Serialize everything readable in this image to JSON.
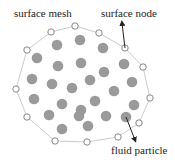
{
  "labels": {
    "surface_mesh": "surface mesh",
    "surface_node": "surface node",
    "fluid_particle": "fluid particle"
  },
  "colors": {
    "mesh_line": "#bdbdbd",
    "node_stroke": "#7a7a7a",
    "node_fill": "#ffffff",
    "particle_fill": "#9a9a9a",
    "arrow": "#222222"
  },
  "surface_nodes": [
    [
      27,
      50
    ],
    [
      51,
      32
    ],
    [
      75,
      26
    ],
    [
      99,
      33
    ],
    [
      125,
      48
    ],
    [
      143,
      67
    ],
    [
      150,
      98
    ],
    [
      139,
      123
    ],
    [
      118,
      137
    ],
    [
      87,
      142
    ],
    [
      55,
      141
    ],
    [
      27,
      117
    ],
    [
      16,
      89
    ]
  ],
  "fluid_particles": [
    [
      57,
      45
    ],
    [
      80,
      40
    ],
    [
      103,
      48
    ],
    [
      37,
      58
    ],
    [
      58,
      66
    ],
    [
      81,
      63
    ],
    [
      104,
      72
    ],
    [
      124,
      64
    ],
    [
      32,
      79
    ],
    [
      52,
      84
    ],
    [
      72,
      88
    ],
    [
      90,
      80
    ],
    [
      114,
      91
    ],
    [
      132,
      82
    ],
    [
      34,
      99
    ],
    [
      62,
      104
    ],
    [
      81,
      110
    ],
    [
      95,
      101
    ],
    [
      134,
      105
    ],
    [
      49,
      115
    ],
    [
      79,
      116
    ],
    [
      106,
      116
    ],
    [
      126,
      117
    ],
    [
      62,
      129
    ],
    [
      88,
      126
    ]
  ],
  "arrows": [
    {
      "name": "surface-node-arrow",
      "from": [
        125,
        48
      ],
      "to": [
        122,
        23
      ]
    },
    {
      "name": "fluid-particle-arrow",
      "from": [
        126,
        117
      ],
      "to": [
        135,
        140
      ]
    }
  ]
}
